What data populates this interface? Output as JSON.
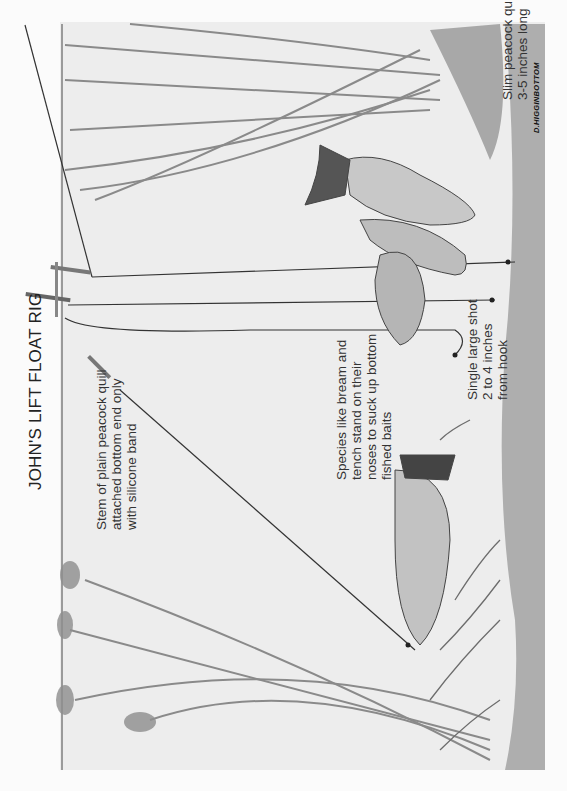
{
  "diagram": {
    "title": "JOHN'S LIFT FLOAT RIG",
    "signature": "D.HIGGINBOTTOM",
    "annotations": {
      "slim_quill": [
        "Slim peacock quill",
        "3-5 inches long"
      ],
      "stem_quill": [
        "Stem of plain peacock quill",
        "attached bottom end only",
        "with silicone band"
      ],
      "species": [
        "Species like bream and",
        "tench stand on their",
        "noses to suck up bottom",
        "fished baits"
      ],
      "shot": [
        "Single large shot",
        "2 to 4 inches",
        "from hook"
      ]
    },
    "elements": [
      "lift floats",
      "fishing lines",
      "split shot",
      "hooks",
      "tench",
      "bream",
      "weeds",
      "lily stems",
      "lakebed"
    ],
    "colors": {
      "background": "#ededed",
      "ink": "#333333",
      "bed": "#6a6a6a"
    }
  }
}
